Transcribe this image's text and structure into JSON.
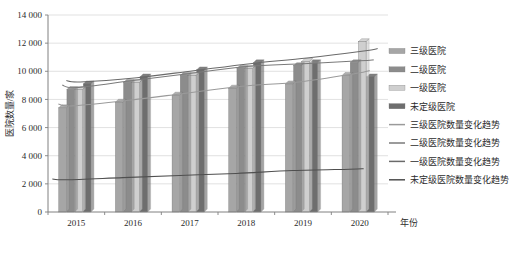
{
  "chart_data": {
    "type": "bar",
    "title": "",
    "subtitle": "",
    "xlabel": "年份",
    "ylabel": "医院数量/家",
    "categories": [
      "2015",
      "2016",
      "2017",
      "2018",
      "2019",
      "2020"
    ],
    "ylim": [
      0,
      14000
    ],
    "yticks": [
      0,
      2000,
      4000,
      6000,
      8000,
      10000,
      12000,
      14000
    ],
    "ytick_labels": [
      "0",
      "2 000",
      "4 000",
      "6 000",
      "8 000",
      "10 000",
      "12 000",
      "14 000"
    ],
    "grid": true,
    "legend_position": "right",
    "series": [
      {
        "name": "三级医院",
        "type": "bar",
        "color": "#a6a6a6",
        "values": [
          7400,
          7800,
          8300,
          8800,
          9100,
          9700
        ]
      },
      {
        "name": "二级医院",
        "type": "bar",
        "color": "#8c8c8c",
        "values": [
          8700,
          9200,
          9700,
          10200,
          10400,
          10600
        ]
      },
      {
        "name": "一级医院",
        "type": "bar",
        "color": "#cfcfcf",
        "values": [
          8700,
          9200,
          9700,
          10200,
          10700,
          12100
        ]
      },
      {
        "name": "未定级医院",
        "type": "bar",
        "color": "#6e6e6e",
        "values": [
          9100,
          9600,
          10100,
          10600,
          10600,
          9600
        ]
      },
      {
        "name": "三级医院数量变化趋势",
        "type": "line",
        "color": "#9a9a9a",
        "values": [
          7400,
          7800,
          8300,
          8800,
          9100,
          9700
        ]
      },
      {
        "name": "二级医院数量变化趋势",
        "type": "line",
        "color": "#7a7a7a",
        "values": [
          8700,
          9200,
          9700,
          10200,
          10400,
          10600
        ]
      },
      {
        "name": "一级医院数量变化趋势",
        "type": "line",
        "color": "#6a6a6a",
        "values": [
          9100,
          9400,
          9900,
          10400,
          10800,
          11300
        ]
      },
      {
        "name": "未定级医院数量变化趋势",
        "type": "line",
        "color": "#4f4f4f",
        "values": [
          2150,
          2300,
          2450,
          2600,
          2800,
          2900
        ]
      }
    ],
    "legend": [
      {
        "label": "三级医院",
        "marker": "bar",
        "color": "#a6a6a6"
      },
      {
        "label": "二级医院",
        "marker": "bar",
        "color": "#8c8c8c"
      },
      {
        "label": "一级医院",
        "marker": "bar",
        "color": "#cfcfcf"
      },
      {
        "label": "未定级医院",
        "marker": "bar",
        "color": "#6e6e6e"
      },
      {
        "label": "三级医院数量变化趋势",
        "marker": "line",
        "color": "#9a9a9a"
      },
      {
        "label": "二级医院数量变化趋势",
        "marker": "line",
        "color": "#7a7a7a"
      },
      {
        "label": "一级医院数量变化趋势",
        "marker": "line",
        "color": "#6a6a6a"
      },
      {
        "label": "未定级医院数量变化趋势",
        "marker": "line",
        "color": "#4f4f4f"
      }
    ]
  },
  "colors": {
    "axis": "#808080",
    "grid": "#d9d9d9",
    "text": "#2b2b2b",
    "background": "#ffffff"
  }
}
